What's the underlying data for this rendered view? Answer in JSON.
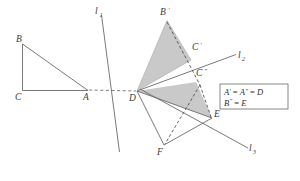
{
  "figure": {
    "kind": "geometry-diagram",
    "width": 300,
    "height": 181,
    "background_color": "#ffffff",
    "stroke_color": "#5a5a5a",
    "shade_fill": "#c9c9c9",
    "label_color": "#3a3a3a"
  },
  "lines": [
    {
      "name": "l1",
      "label": "l",
      "sub": "1",
      "x1": 101.5,
      "y1": 15.0,
      "x2": 119.5,
      "y2": 152.0,
      "label_x": 96.0,
      "label_y": 14.0
    },
    {
      "name": "l2",
      "label": "l",
      "sub": "2",
      "x1": 137.0,
      "y1": 91.0,
      "x2": 236.0,
      "y2": 54.5,
      "label_x": 239.0,
      "label_y": 58.0
    },
    {
      "name": "l3",
      "label": "l",
      "sub": "3",
      "x1": 140.0,
      "y1": 89.0,
      "x2": 248.0,
      "y2": 148.0,
      "label_x": 250.0,
      "label_y": 151.0
    }
  ],
  "triangles": [
    {
      "name": "triangle-ABC",
      "shaded": false,
      "vertices": [
        {
          "label": "A",
          "prime": "",
          "x": 88.0,
          "y": 90.5,
          "label_x": 83.0,
          "label_y": 100.0
        },
        {
          "label": "B",
          "prime": "",
          "x": 22.5,
          "y": 44.0,
          "label_x": 16.0,
          "label_y": 42.0
        },
        {
          "label": "C",
          "prime": "",
          "x": 22.5,
          "y": 90.5,
          "label_x": 15.0,
          "label_y": 100.0
        }
      ]
    },
    {
      "name": "triangle-A-prime-B-prime-C-prime",
      "shaded": true,
      "vertices": [
        {
          "label": "A",
          "prime": "'",
          "x": 137.0,
          "y": 91.0,
          "label_x": 0,
          "label_y": 0
        },
        {
          "label": "B",
          "prime": "'",
          "x": 167.0,
          "y": 20.5,
          "label_x": 161.0,
          "label_y": 15.0
        },
        {
          "label": "C",
          "prime": "'",
          "x": 191.0,
          "y": 60.0,
          "label_x": 193.0,
          "label_y": 50.0
        }
      ]
    },
    {
      "name": "triangle-A-dprime-B-dprime-C-dprime",
      "shaded": true,
      "vertices": [
        {
          "label": "A",
          "prime": "\"",
          "x": 137.0,
          "y": 91.0,
          "label_x": 0,
          "label_y": 0
        },
        {
          "label": "B",
          "prime": "\"",
          "x": 212.0,
          "y": 118.0,
          "label_x": 0,
          "label_y": 0
        },
        {
          "label": "C",
          "prime": "\"",
          "x": 196.0,
          "y": 82.0,
          "label_x": 197.0,
          "label_y": 76.0
        }
      ]
    },
    {
      "name": "triangle-DEF",
      "shaded": false,
      "vertices": [
        {
          "label": "D",
          "prime": "",
          "x": 137.0,
          "y": 91.0,
          "label_x": 130.0,
          "label_y": 101.0
        },
        {
          "label": "E",
          "prime": "",
          "x": 212.0,
          "y": 118.0,
          "label_x": 214.0,
          "label_y": 116.0
        },
        {
          "label": "F",
          "prime": "",
          "x": 164.0,
          "y": 145.0,
          "label_x": 158.0,
          "label_y": 155.0
        }
      ]
    }
  ],
  "dashed_segments": [
    {
      "name": "A-to-D-ray",
      "x1": 89.0,
      "y1": 90.0,
      "x2": 136.0,
      "y2": 91.0
    },
    {
      "name": "B-prime-to-C-dprime",
      "x1": 167.0,
      "y1": 22.0,
      "x2": 200.0,
      "y2": 85.0
    },
    {
      "name": "C-dprime-to-E",
      "x1": 200.0,
      "y1": 85.0,
      "x2": 211.0,
      "y2": 117.0
    },
    {
      "name": "C-dprime-to-F",
      "x1": 200.0,
      "y1": 85.0,
      "x2": 165.0,
      "y2": 144.0
    }
  ],
  "legend": {
    "name": "equality-legend",
    "box": {
      "x": 220.0,
      "y": 84.0,
      "width": 68.0,
      "height": 25.0
    },
    "lines": [
      {
        "parts": [
          "A",
          "'",
          " = ",
          "A",
          "\"",
          " = ",
          "D"
        ],
        "text": "A' = A\" = D"
      },
      {
        "parts": [
          "B",
          "\"",
          " = ",
          "E"
        ],
        "text": "B\" = E"
      }
    ]
  }
}
